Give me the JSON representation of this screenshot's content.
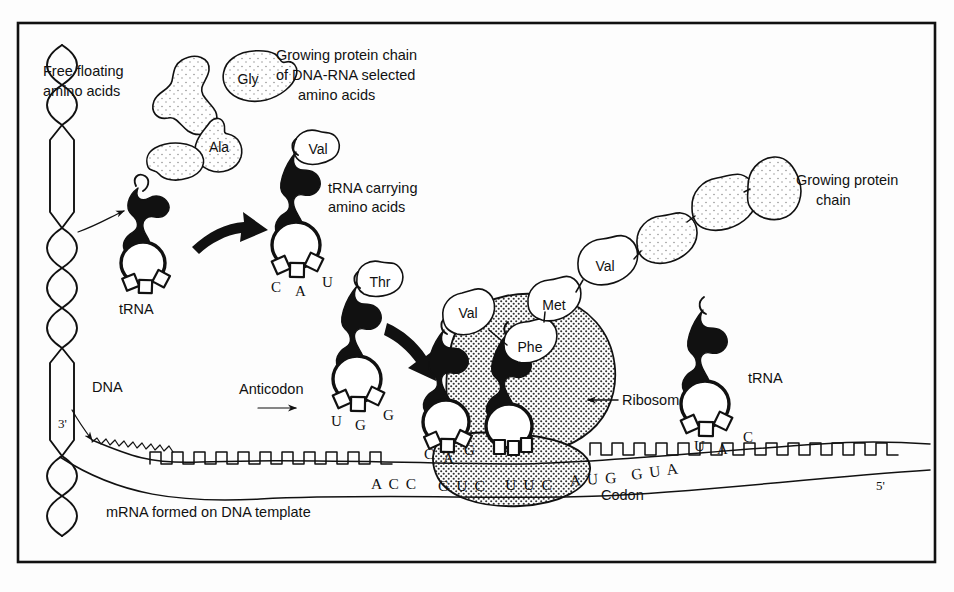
{
  "figure": {
    "frame": {
      "x": 17,
      "y": 22,
      "width": 919,
      "height": 541
    }
  },
  "labels": {
    "free_floating": "Free floating\namino acids",
    "free_floating_line1": "Free floating",
    "free_floating_line2": "amino acids",
    "growing_chain_selected_line1": "Growing protein chain",
    "growing_chain_selected_line2": "of DNA-RNA selected",
    "growing_chain_selected_line3": "amino acids",
    "trna_carrying_line1": "tRNA carrying",
    "trna_carrying_line2": "amino acids",
    "growing_chain_right_line1": "Growing protein",
    "growing_chain_right_line2": "chain",
    "trna_left": "tRNA",
    "trna_right": "tRNA",
    "dna": "DNA",
    "three_prime": "3'",
    "five_prime": "5'",
    "anticodon": "Anticodon",
    "ribosome": "Ribosome",
    "codon": "Codon",
    "mrna_template": "mRNA formed on DNA template"
  },
  "amino_acids": {
    "free": [
      {
        "name": "",
        "cx": 196,
        "cy": 95
      },
      {
        "name": "Gly",
        "cx": 247,
        "cy": 79
      },
      {
        "name": "Ala",
        "cx": 219,
        "cy": 146
      },
      {
        "name": "",
        "cx": 177,
        "cy": 160
      }
    ],
    "carried": [
      {
        "name": "Val",
        "cx": 315,
        "cy": 152
      },
      {
        "name": "Thr",
        "cx": 379,
        "cy": 283
      }
    ],
    "chain": [
      {
        "name": "Val",
        "cx": 466,
        "cy": 330
      },
      {
        "name": "Phe",
        "cx": 528,
        "cy": 351
      },
      {
        "name": "Met",
        "cx": 551,
        "cy": 308
      },
      {
        "name": "Val",
        "cx": 601,
        "cy": 268
      },
      {
        "name": "",
        "cx": 663,
        "cy": 241
      },
      {
        "name": "",
        "cx": 718,
        "cy": 205
      },
      {
        "name": "",
        "cx": 765,
        "cy": 188
      }
    ]
  },
  "trna_molecules": [
    {
      "id": "trna-free-left",
      "label": "tRNA",
      "anticodon": [],
      "x": 141,
      "y": 230
    },
    {
      "id": "trna-val-carrying",
      "label": "",
      "anticodon": [
        "C",
        "A",
        "U"
      ],
      "x": 300,
      "y": 215
    },
    {
      "id": "trna-thr-anticodon",
      "label": "",
      "anticodon": [
        "U",
        "G",
        "G"
      ],
      "x": 355,
      "y": 350
    },
    {
      "id": "trna-ribosome-a",
      "label": "",
      "anticodon": [
        "C",
        "A",
        "G"
      ],
      "x": 455,
      "y": 390
    },
    {
      "id": "trna-ribosome-b",
      "label": "",
      "anticodon": [],
      "x": 518,
      "y": 395
    },
    {
      "id": "trna-right-free",
      "label": "tRNA",
      "anticodon": [
        "U",
        "A",
        "C"
      ],
      "x": 718,
      "y": 350
    }
  ],
  "mrna": {
    "codons": [
      "A C C",
      "G U C",
      "U U C",
      "A U G",
      "G U A"
    ],
    "codon_positions": [
      {
        "text": "A C C",
        "x": 371,
        "y": 484
      },
      {
        "text": "G U C",
        "x": 438,
        "y": 486
      },
      {
        "text": "U U C",
        "x": 503,
        "y": 485
      },
      {
        "text": "A U G",
        "x": 568,
        "y": 482
      },
      {
        "text": "G U A",
        "x": 628,
        "y": 477
      }
    ],
    "five_prime_pos": {
      "x": 881,
      "y": 487
    },
    "three_prime_pos": {
      "x": 67,
      "y": 424
    }
  },
  "colors": {
    "ink": "#111111",
    "paper": "#fdfdfd",
    "stipple": "#6b6b6b",
    "ribosome_fill": "#d8d8d8"
  }
}
